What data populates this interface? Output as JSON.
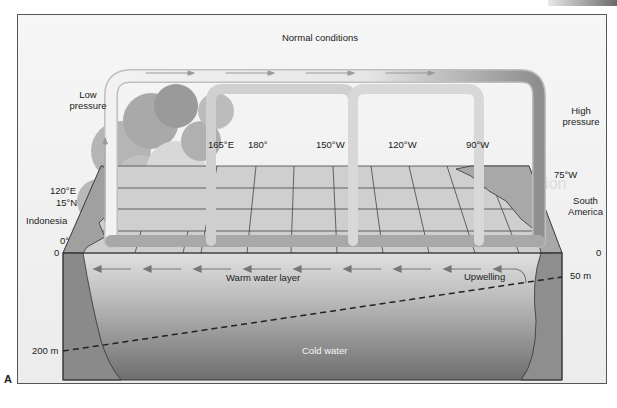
{
  "figure": {
    "title": "Normal conditions",
    "panel_label": "A",
    "watermark": "The North Atlantic Oscillation"
  },
  "atmosphere": {
    "low_pressure": [
      "Low",
      "pressure"
    ],
    "high_pressure": [
      "High",
      "pressure"
    ]
  },
  "longitudes": [
    {
      "label": "165°E"
    },
    {
      "label": "180°"
    },
    {
      "label": "150°W"
    },
    {
      "label": "120°W"
    },
    {
      "label": "90°W"
    }
  ],
  "geography": {
    "west": {
      "lon": "120°E",
      "lat": "15°N",
      "region": "Indonesia",
      "equator": "0°"
    },
    "east": {
      "lon": "75°W",
      "region": [
        "South",
        "America"
      ]
    }
  },
  "ocean": {
    "surface_left": "0",
    "surface_right": "0",
    "depth_left": "200 m",
    "depth_right": "50 m",
    "warm_layer": "Warm water layer",
    "upwelling": "Upwelling",
    "cold_layer": "Cold water"
  },
  "colors": {
    "frame_bg": "#f4f4f4",
    "grid_top": "#c8c8c8",
    "warm_water": "#d4d4d4",
    "cold_water": "#7a7a7a",
    "land": "#9a9a9a",
    "cell_tube": "#e2e2e2",
    "cell_dark": "#9c9c9c"
  }
}
